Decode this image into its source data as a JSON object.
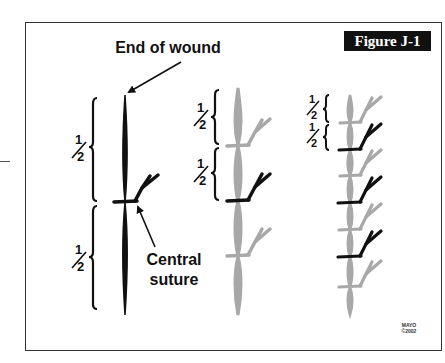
{
  "figure": {
    "label": "Figure J-1",
    "callouts": {
      "end_of_wound": "End of wound",
      "central_suture_line1": "Central",
      "central_suture_line2": "suture"
    },
    "fraction_label": "1/2",
    "fraction_numerator": "1",
    "fraction_denominator": "2",
    "credit": {
      "line1": "MAYO",
      "line2": "©2002"
    }
  },
  "panels": [
    {
      "name": "step-1",
      "description": "Single central suture bisects wound",
      "segments": [
        "1/2",
        "1/2"
      ],
      "sutures": [
        {
          "color": "black"
        }
      ]
    },
    {
      "name": "step-2",
      "description": "Sutures placed bisecting each half",
      "segments": [
        "1/2",
        "1/2"
      ],
      "sutures": [
        {
          "color": "gray"
        },
        {
          "color": "black"
        },
        {
          "color": "gray"
        }
      ]
    },
    {
      "name": "step-3",
      "description": "Continued bisection until wound closed",
      "segments": [
        "1/2",
        "1/2"
      ],
      "sutures": [
        {
          "color": "gray"
        },
        {
          "color": "black"
        },
        {
          "color": "gray"
        },
        {
          "color": "black"
        },
        {
          "color": "gray"
        },
        {
          "color": "black"
        },
        {
          "color": "gray"
        }
      ]
    }
  ],
  "colors": {
    "black_suture": "#111111",
    "gray_suture": "#a8a8a8",
    "label_bg": "#111111",
    "label_text": "#ffffff",
    "frame": "#333333"
  }
}
